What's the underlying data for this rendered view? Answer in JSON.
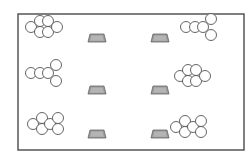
{
  "diagram": {
    "colors": {
      "background": "#ffffff",
      "frame": "#555555",
      "circle_stroke": "#555555",
      "desk_fill": "#9a9a9a",
      "desk_stroke": "#666666",
      "desk_inner": "#b4b4b4"
    },
    "frame": {
      "x": 18,
      "y": 14,
      "width": 226,
      "height": 136
    },
    "circle_radius": 5.5,
    "desks": [
      {
        "id": "desk-left-top",
        "x": 97,
        "y": 38
      },
      {
        "id": "desk-right-top",
        "x": 160,
        "y": 38
      },
      {
        "id": "desk-left-middle",
        "x": 97,
        "y": 90
      },
      {
        "id": "desk-right-middle",
        "x": 160,
        "y": 90
      },
      {
        "id": "desk-left-bottom",
        "x": 97,
        "y": 134
      },
      {
        "id": "desk-right-bottom",
        "x": 160,
        "y": 134
      }
    ],
    "groups": [
      {
        "id": "group-left-top",
        "count": 6,
        "circles": [
          [
            31,
            27
          ],
          [
            40,
            21
          ],
          [
            48,
            21
          ],
          [
            40,
            32
          ],
          [
            48,
            32
          ],
          [
            57,
            27
          ]
        ]
      },
      {
        "id": "group-left-middle",
        "count": 5,
        "circles": [
          [
            31,
            73
          ],
          [
            40,
            73
          ],
          [
            48,
            73
          ],
          [
            56,
            65
          ],
          [
            56,
            81
          ]
        ]
      },
      {
        "id": "group-left-bottom",
        "count": 6,
        "circles": [
          [
            33,
            124
          ],
          [
            42,
            118
          ],
          [
            42,
            129
          ],
          [
            50,
            124
          ],
          [
            58,
            118
          ],
          [
            58,
            129
          ]
        ]
      },
      {
        "id": "group-right-top",
        "count": 5,
        "circles": [
          [
            186,
            27
          ],
          [
            195,
            27
          ],
          [
            203,
            27
          ],
          [
            211,
            19
          ],
          [
            211,
            35
          ]
        ]
      },
      {
        "id": "group-right-middle",
        "count": 6,
        "circles": [
          [
            180,
            76
          ],
          [
            188,
            70
          ],
          [
            196,
            70
          ],
          [
            188,
            81
          ],
          [
            196,
            81
          ],
          [
            205,
            76
          ]
        ]
      },
      {
        "id": "group-right-bottom",
        "count": 6,
        "circles": [
          [
            176,
            127
          ],
          [
            185,
            121
          ],
          [
            185,
            132
          ],
          [
            193,
            127
          ],
          [
            201,
            121
          ],
          [
            201,
            132
          ]
        ]
      }
    ]
  }
}
